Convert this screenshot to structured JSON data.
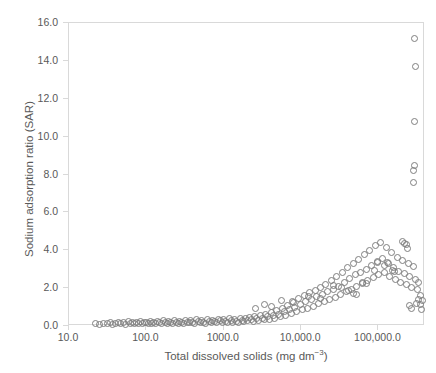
{
  "chart_data": {
    "type": "scatter",
    "title": "",
    "xlabel": "Total dissolved solids (mg dm−3)",
    "ylabel": "Sodium adsorption ratio (SAR)",
    "xscale": "log",
    "yscale": "linear",
    "xlim": [
      10,
      400000
    ],
    "ylim": [
      0,
      16
    ],
    "yticks": [
      "0.0",
      "2.0",
      "4.0",
      "6.0",
      "8.0",
      "10.0",
      "12.0",
      "14.0",
      "16.0"
    ],
    "ytick_values": [
      0,
      2,
      4,
      6,
      8,
      10,
      12,
      14,
      16
    ],
    "xticks": [
      "10.0",
      "100.0",
      "1000.0",
      "10,000.0",
      "100,000.0"
    ],
    "xtick_values": [
      10,
      100,
      1000,
      10000,
      100000
    ],
    "grid": false,
    "legend": null,
    "marker": "open-circle",
    "marker_color": "#7f7f7f",
    "series": [
      {
        "name": "Samples",
        "points": [
          [
            22,
            0.12
          ],
          [
            25,
            0.1
          ],
          [
            28,
            0.15
          ],
          [
            31,
            0.11
          ],
          [
            34,
            0.18
          ],
          [
            37,
            0.09
          ],
          [
            40,
            0.14
          ],
          [
            43,
            0.2
          ],
          [
            46,
            0.12
          ],
          [
            50,
            0.16
          ],
          [
            54,
            0.1
          ],
          [
            58,
            0.22
          ],
          [
            62,
            0.13
          ],
          [
            66,
            0.17
          ],
          [
            70,
            0.11
          ],
          [
            75,
            0.19
          ],
          [
            80,
            0.14
          ],
          [
            85,
            0.23
          ],
          [
            90,
            0.12
          ],
          [
            95,
            0.16
          ],
          [
            100,
            0.2
          ],
          [
            106,
            0.13
          ],
          [
            112,
            0.25
          ],
          [
            118,
            0.15
          ],
          [
            125,
            0.18
          ],
          [
            132,
            0.11
          ],
          [
            140,
            0.22
          ],
          [
            148,
            0.16
          ],
          [
            156,
            0.13
          ],
          [
            165,
            0.27
          ],
          [
            175,
            0.19
          ],
          [
            185,
            0.14
          ],
          [
            195,
            0.24
          ],
          [
            206,
            0.17
          ],
          [
            218,
            0.12
          ],
          [
            230,
            0.28
          ],
          [
            243,
            0.2
          ],
          [
            257,
            0.15
          ],
          [
            272,
            0.26
          ],
          [
            287,
            0.18
          ],
          [
            303,
            0.13
          ],
          [
            320,
            0.3
          ],
          [
            338,
            0.21
          ],
          [
            357,
            0.16
          ],
          [
            377,
            0.27
          ],
          [
            398,
            0.19
          ],
          [
            420,
            0.14
          ],
          [
            444,
            0.32
          ],
          [
            469,
            0.23
          ],
          [
            495,
            0.17
          ],
          [
            523,
            0.29
          ],
          [
            552,
            0.2
          ],
          [
            583,
            0.15
          ],
          [
            616,
            0.34
          ],
          [
            650,
            0.25
          ],
          [
            686,
            0.18
          ],
          [
            725,
            0.31
          ],
          [
            765,
            0.22
          ],
          [
            808,
            0.16
          ],
          [
            853,
            0.36
          ],
          [
            901,
            0.27
          ],
          [
            951,
            0.19
          ],
          [
            1004,
            0.33
          ],
          [
            1060,
            0.24
          ],
          [
            1119,
            0.17
          ],
          [
            1182,
            0.38
          ],
          [
            1248,
            0.28
          ],
          [
            1318,
            0.21
          ],
          [
            1391,
            0.35
          ],
          [
            1469,
            0.26
          ],
          [
            1551,
            0.19
          ],
          [
            1638,
            0.4
          ],
          [
            1729,
            0.3
          ],
          [
            1826,
            0.23
          ],
          [
            1928,
            0.37
          ],
          [
            2035,
            0.28
          ],
          [
            2149,
            0.45
          ],
          [
            2269,
            0.33
          ],
          [
            2396,
            0.25
          ],
          [
            2530,
            0.5
          ],
          [
            2671,
            0.38
          ],
          [
            2820,
            0.3
          ],
          [
            2977,
            0.55
          ],
          [
            3143,
            0.42
          ],
          [
            3319,
            0.32
          ],
          [
            3504,
            0.62
          ],
          [
            3700,
            0.48
          ],
          [
            3906,
            0.36
          ],
          [
            4124,
            0.7
          ],
          [
            4354,
            0.55
          ],
          [
            4597,
            0.42
          ],
          [
            4853,
            0.8
          ],
          [
            5123,
            0.62
          ],
          [
            5408,
            0.48
          ],
          [
            5710,
            0.95
          ],
          [
            6028,
            0.75
          ],
          [
            6364,
            0.55
          ],
          [
            6718,
            1.1
          ],
          [
            7092,
            0.85
          ],
          [
            7487,
            0.65
          ],
          [
            7904,
            1.25
          ],
          [
            8345,
            1.0
          ],
          [
            8810,
            0.75
          ],
          [
            9301,
            1.45
          ],
          [
            9820,
            1.15
          ],
          [
            10368,
            0.85
          ],
          [
            10946,
            1.6
          ],
          [
            11556,
            1.3
          ],
          [
            12200,
            0.95
          ],
          [
            12880,
            1.75
          ],
          [
            13598,
            1.4
          ],
          [
            14356,
            1.05
          ],
          [
            15156,
            1.9
          ],
          [
            16001,
            1.55
          ],
          [
            16893,
            1.2
          ],
          [
            17835,
            2.05
          ],
          [
            18829,
            1.65
          ],
          [
            19879,
            1.3
          ],
          [
            20988,
            2.2
          ],
          [
            22158,
            1.8
          ],
          [
            23394,
            1.4
          ],
          [
            24699,
            2.4
          ],
          [
            26076,
            1.95
          ],
          [
            27530,
            1.5
          ],
          [
            29065,
            2.6
          ],
          [
            30686,
            2.1
          ],
          [
            32397,
            1.65
          ],
          [
            34204,
            2.85
          ],
          [
            36111,
            2.3
          ],
          [
            38125,
            1.8
          ],
          [
            40251,
            3.1
          ],
          [
            42495,
            2.5
          ],
          [
            44865,
            1.95
          ],
          [
            47367,
            3.3
          ],
          [
            50008,
            2.7
          ],
          [
            52797,
            2.1
          ],
          [
            55741,
            3.5
          ],
          [
            58849,
            2.85
          ],
          [
            62131,
            2.25
          ],
          [
            65596,
            3.75
          ],
          [
            69254,
            3.0
          ],
          [
            73116,
            2.4
          ],
          [
            77194,
            4.0
          ],
          [
            81499,
            3.2
          ],
          [
            86044,
            2.55
          ],
          [
            90843,
            4.25
          ],
          [
            95910,
            3.4
          ],
          [
            101260,
            2.7
          ],
          [
            106908,
            4.4
          ],
          [
            112870,
            3.55
          ],
          [
            119165,
            2.85
          ],
          [
            125811,
            4.15
          ],
          [
            132828,
            3.35
          ],
          [
            140236,
            2.6
          ],
          [
            148057,
            3.9
          ],
          [
            156315,
            3.1
          ],
          [
            165033,
            2.45
          ],
          [
            174238,
            3.6
          ],
          [
            183956,
            2.9
          ],
          [
            194216,
            2.3
          ],
          [
            205049,
            3.45
          ],
          [
            216485,
            2.75
          ],
          [
            228560,
            2.2
          ],
          [
            241308,
            3.3
          ],
          [
            254768,
            2.6
          ],
          [
            268979,
            2.05
          ],
          [
            283984,
            3.15
          ],
          [
            299827,
            2.45
          ],
          [
            316555,
            1.95
          ],
          [
            334218,
            2.3
          ],
          [
            352866,
            1.6
          ],
          [
            372557,
            1.35
          ],
          [
            289000,
            15.2
          ],
          [
            300000,
            13.7
          ],
          [
            295000,
            10.8
          ],
          [
            292000,
            8.5
          ],
          [
            283000,
            8.2
          ],
          [
            288000,
            7.6
          ],
          [
            205000,
            4.45
          ],
          [
            218000,
            4.35
          ],
          [
            228000,
            4.3
          ],
          [
            238000,
            4.1
          ],
          [
            120000,
            3.2
          ],
          [
            135000,
            3.3
          ],
          [
            98000,
            3.35
          ],
          [
            88000,
            2.95
          ],
          [
            150000,
            2.95
          ],
          [
            160000,
            2.9
          ],
          [
            62000,
            2.3
          ],
          [
            70000,
            2.25
          ],
          [
            48000,
            1.7
          ],
          [
            52000,
            1.65
          ],
          [
            5600,
            1.35
          ],
          [
            7800,
            1.3
          ],
          [
            3400,
            1.15
          ],
          [
            4200,
            1.05
          ],
          [
            2600,
            0.95
          ],
          [
            12500,
            1.55
          ],
          [
            18000,
            1.45
          ],
          [
            26000,
            2.15
          ],
          [
            33000,
            2.05
          ],
          [
            41000,
            1.9
          ],
          [
            255000,
            1.1
          ],
          [
            268000,
            0.9
          ],
          [
            310000,
            1.2
          ],
          [
            330000,
            1.4
          ],
          [
            345000,
            1.15
          ],
          [
            360000,
            0.85
          ]
        ]
      }
    ]
  }
}
